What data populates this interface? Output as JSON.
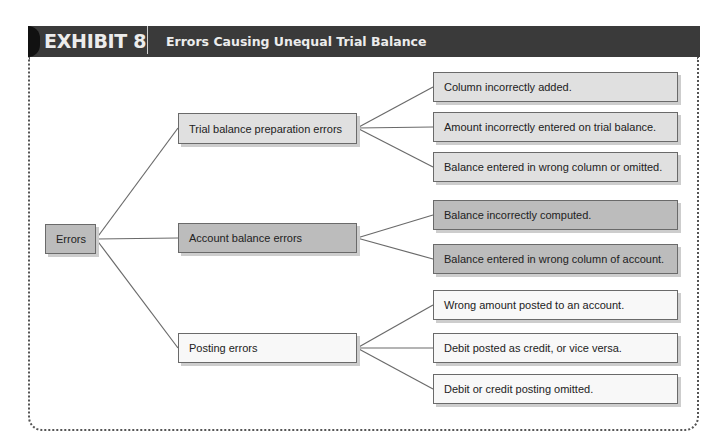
{
  "header": {
    "exhibit_label": "EXHIBIT 8",
    "title": "Errors Causing Unequal Trial Balance"
  },
  "diagram": {
    "root": {
      "label": "Errors"
    },
    "categories": [
      {
        "label": "Trial balance preparation errors",
        "items": [
          "Column incorrectly added.",
          "Amount incorrectly entered on trial balance.",
          "Balance entered in wrong column or omitted."
        ]
      },
      {
        "label": "Account balance errors",
        "items": [
          "Balance incorrectly computed.",
          "Balance entered in wrong column of account."
        ]
      },
      {
        "label": "Posting errors",
        "items": [
          "Wrong amount posted to an account.",
          "Debit posted as credit, or vice versa.",
          "Debit or credit posting omitted."
        ]
      }
    ]
  },
  "colors": {
    "header_bg": "#3a3a3a",
    "header_text": "#ececec",
    "box_light": "#e0e0e0",
    "box_dark": "#bcbcbc",
    "box_white": "#f8f8f8",
    "box_border": "#6a6a6a",
    "connector": "#6a6a6a"
  }
}
